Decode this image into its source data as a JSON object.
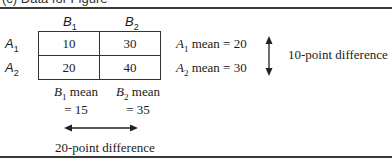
{
  "caption": "(c) Data for Figure",
  "columns": [
    {
      "label": "B",
      "sub": "1"
    },
    {
      "label": "B",
      "sub": "2"
    }
  ],
  "rows": [
    {
      "label": "A",
      "sub": "1",
      "values": [
        "10",
        "30"
      ],
      "mean_text": " mean = 20"
    },
    {
      "label": "A",
      "sub": "2",
      "values": [
        "20",
        "40"
      ],
      "mean_text": " mean = 30"
    }
  ],
  "column_means": [
    {
      "label": "B",
      "sub": "1",
      "line1": " mean",
      "line2": "= 15"
    },
    {
      "label": "B",
      "sub": "2",
      "line1": " mean",
      "line2": "= 35"
    }
  ],
  "row_difference": "10-point difference",
  "column_difference": "20-point difference",
  "icons": {
    "vertical_arrow": "double-headed-vertical-arrow",
    "horizontal_arrow": "double-headed-horizontal-arrow"
  }
}
